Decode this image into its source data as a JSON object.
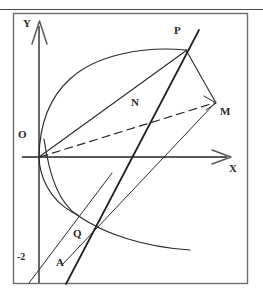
{
  "figure": {
    "title_faded": "",
    "background_color": "#ffffff",
    "stroke_color": "#2b2b2b",
    "axis_color": "#5a5a5a",
    "frame_color": "#6e6e6e",
    "width": 263,
    "height": 303
  },
  "axes": {
    "origin": {
      "x": 39,
      "y": 157,
      "label": "O",
      "label_x": 19,
      "label_y": 130
    },
    "x_axis": {
      "label": "X",
      "label_x": 230,
      "label_y": 164,
      "from_x": 22,
      "to_x": 231,
      "y": 157
    },
    "y_axis": {
      "label": "Y",
      "label_x": 24,
      "label_y": 18,
      "x": 39,
      "from_y": 20,
      "to_y": 284
    },
    "y_tick": {
      "label": "-2",
      "label_x": 17,
      "label_y": 252,
      "value": -2
    }
  },
  "points": [
    {
      "name": "P",
      "x": 186,
      "y": 50,
      "label": "P",
      "label_x": 176,
      "label_y": 25
    },
    {
      "name": "M",
      "x": 215,
      "y": 102,
      "label": "M",
      "label_x": 221,
      "label_y": 106
    },
    {
      "name": "N",
      "x": 146,
      "y": 123,
      "label": "N",
      "label_x": 133,
      "label_y": 97
    },
    {
      "name": "Q",
      "x": 77,
      "y": 215,
      "label": "Q",
      "label_x": 74,
      "label_y": 227
    },
    {
      "name": "A",
      "x": 47,
      "y": 262,
      "label": "A",
      "label_x": 55,
      "label_y": 256
    },
    {
      "name": "O",
      "x": 39,
      "y": 157,
      "label": "O",
      "label_x": 19,
      "label_y": 130
    }
  ],
  "curves": {
    "parabola": {
      "kind": "parabola-right-opening",
      "description": "curve through O, P and Q",
      "path": "M 39 157 C 40 120 55 88 86 69 C 118 50 158 47 186 50"
    },
    "parabola_lower": {
      "kind": "parabola-right-opening-lower",
      "description": "lower branch from O down through Q",
      "path": "M 39 157 C 40 175 52 198 77 215"
    },
    "hyperbola": {
      "kind": "hyperbola-branch",
      "description": "decreasing curve from near Y axis down to lower right through Q",
      "path": "M 42 147 C 50 184 62 205 77 215 C 107 236 145 248 190 250"
    }
  },
  "segments": [
    {
      "name": "OP",
      "from": "O",
      "to": "P",
      "style": "solid",
      "x1": 39,
      "y1": 157,
      "x2": 186,
      "y2": 50
    },
    {
      "name": "PM",
      "from": "P",
      "to": "M",
      "style": "solid",
      "x1": 186,
      "y1": 50,
      "x2": 215,
      "y2": 102
    },
    {
      "name": "OM",
      "from": "O",
      "to": "M",
      "style": "dashed",
      "x1": 39,
      "y1": 157,
      "x2": 215,
      "y2": 102
    },
    {
      "name": "QP",
      "from": "Q",
      "to": "P",
      "style": "solid-bold",
      "x1": 66,
      "y1": 284,
      "x2": 198,
      "y2": 31
    },
    {
      "name": "QM",
      "from": "Q",
      "to": "M",
      "style": "solid",
      "x1": 77,
      "y1": 215,
      "x2": 215,
      "y2": 102
    },
    {
      "name": "AQ",
      "from": "A",
      "to": "Q",
      "style": "solid",
      "x1": 30,
      "y1": 284,
      "x2": 106,
      "y2": 184
    }
  ],
  "labels": {
    "Y": "Y",
    "X": "X",
    "O": "O",
    "P": "P",
    "N": "N",
    "M": "M",
    "Q": "Q",
    "A": "A",
    "neg_two": "-2"
  }
}
